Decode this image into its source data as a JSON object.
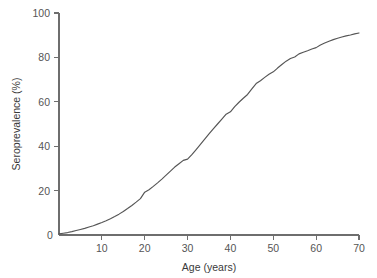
{
  "chart_data": {
    "type": "line",
    "title": "",
    "subtitle": "",
    "xlabel": "Age (years)",
    "ylabel": "Seroprevalence (%)",
    "xlim": [
      0,
      70
    ],
    "ylim": [
      0,
      100
    ],
    "xticks": [
      0,
      10,
      20,
      30,
      40,
      50,
      60,
      70
    ],
    "xtick_labels": [
      "0",
      "10",
      "20",
      "30",
      "40",
      "50",
      "60",
      "70"
    ],
    "yticks": [
      0,
      20,
      40,
      60,
      80,
      100
    ],
    "ytick_labels": [
      "0",
      "20",
      "40",
      "60",
      "80",
      "100"
    ],
    "grid": false,
    "legend": false,
    "legend_position": "none",
    "line_color": "#555555",
    "axis_color": "#6e6e6e",
    "background_color": "#ffffff",
    "series": [
      {
        "name": "Seroprevalence",
        "x": [
          0,
          1,
          2,
          3,
          4,
          5,
          6,
          7,
          8,
          9,
          10,
          11,
          12,
          13,
          14,
          15,
          16,
          17,
          18,
          19,
          20,
          21,
          22,
          23,
          24,
          25,
          26,
          27,
          28,
          29,
          30,
          31,
          32,
          33,
          34,
          35,
          36,
          37,
          38,
          39,
          40,
          41,
          42,
          43,
          44,
          45,
          46,
          47,
          48,
          49,
          50,
          51,
          52,
          53,
          54,
          55,
          56,
          57,
          58,
          59,
          60,
          61,
          62,
          63,
          64,
          65,
          66,
          67,
          68,
          69,
          70
        ],
        "values": [
          0.5,
          0.8,
          1.1,
          1.5,
          2.0,
          2.5,
          3.0,
          3.6,
          4.2,
          4.9,
          5.6,
          6.4,
          7.3,
          8.3,
          9.4,
          10.6,
          11.9,
          13.3,
          14.8,
          16.4,
          19.3,
          20.4,
          21.9,
          23.5,
          25.2,
          27.0,
          28.8,
          30.6,
          32.1,
          33.6,
          34.2,
          36.2,
          38.5,
          40.8,
          43.2,
          45.5,
          47.8,
          50.0,
          52.2,
          54.4,
          55.5,
          57.8,
          59.8,
          61.6,
          63.3,
          65.8,
          68.2,
          69.5,
          71.0,
          72.4,
          73.5,
          75.2,
          76.8,
          78.3,
          79.5,
          80.2,
          81.6,
          82.3,
          83.0,
          83.8,
          84.4,
          85.6,
          86.5,
          87.3,
          88.0,
          88.6,
          89.2,
          89.7,
          90.1,
          90.6,
          91.0
        ]
      }
    ]
  },
  "axes": {
    "x_title": "Age (years)",
    "y_title": "Seroprevalence (%)"
  }
}
